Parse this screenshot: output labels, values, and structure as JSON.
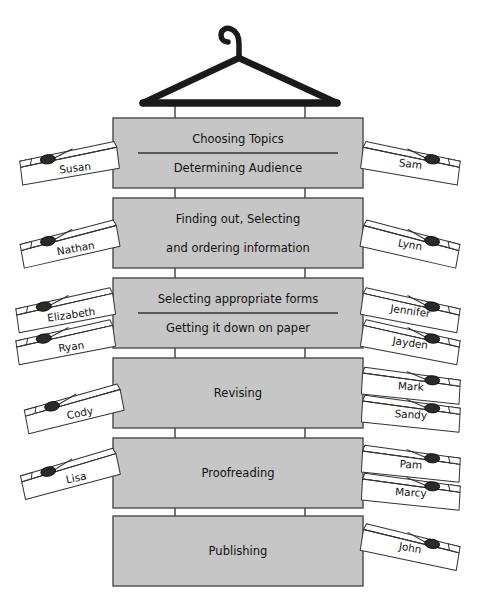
{
  "diagram": {
    "title_visible": false,
    "colors": {
      "box_fill": "#c6c6c6",
      "box_stroke": "#4a4a4a",
      "hanger": "#1a1a1a",
      "pin_fill": "#ffffff",
      "pin_stroke": "#333333",
      "spring_fill": "#2a2a2a",
      "connector": "#555555",
      "page_bg": "#ffffff"
    },
    "hanger": {
      "name": "coat-hanger",
      "hook_top_y": 18,
      "bar_y": 103,
      "bar_left_x": 165,
      "bar_right_x": 315
    },
    "stages": [
      {
        "id": "stage-1",
        "lines": [
          "Choosing Topics",
          "Determining Audience"
        ],
        "divider": true,
        "box": {
          "x": 113,
          "y": 118,
          "w": 250,
          "h": 70
        },
        "left_pins": [
          {
            "name": "Susan",
            "x": 18,
            "y": 140,
            "rot": -7
          }
        ],
        "right_pins": [
          {
            "name": "Sam",
            "x": 360,
            "y": 140,
            "rot": 7
          }
        ]
      },
      {
        "id": "stage-2",
        "lines": [
          "Finding out, Selecting",
          "and ordering information"
        ],
        "divider": false,
        "box": {
          "x": 113,
          "y": 198,
          "w": 250,
          "h": 70
        },
        "left_pins": [
          {
            "name": "Nathan",
            "x": 18,
            "y": 218,
            "rot": -10
          }
        ],
        "right_pins": [
          {
            "name": "Lynn",
            "x": 360,
            "y": 218,
            "rot": 10
          }
        ]
      },
      {
        "id": "stage-3",
        "lines": [
          "Selecting appropriate forms",
          "Getting it down on paper"
        ],
        "divider": true,
        "box": {
          "x": 113,
          "y": 278,
          "w": 250,
          "h": 70
        },
        "left_pins": [
          {
            "name": "Elizabeth",
            "x": 14,
            "y": 286,
            "rot": -8
          },
          {
            "name": "Ryan",
            "x": 14,
            "y": 318,
            "rot": -8
          }
        ],
        "right_pins": [
          {
            "name": "Jennifer",
            "x": 360,
            "y": 286,
            "rot": 8
          },
          {
            "name": "Jayden",
            "x": 360,
            "y": 318,
            "rot": 8
          }
        ]
      },
      {
        "id": "stage-4",
        "lines": [
          "Revising"
        ],
        "divider": false,
        "box": {
          "x": 113,
          "y": 358,
          "w": 250,
          "h": 70
        },
        "left_pins": [
          {
            "name": "Cody",
            "x": 22,
            "y": 382,
            "rot": -11
          }
        ],
        "right_pins": [
          {
            "name": "Mark",
            "x": 360,
            "y": 366,
            "rot": 3
          },
          {
            "name": "Sandy",
            "x": 360,
            "y": 394,
            "rot": 3
          }
        ]
      },
      {
        "id": "stage-5",
        "lines": [
          "Proofreading"
        ],
        "divider": false,
        "box": {
          "x": 113,
          "y": 438,
          "w": 250,
          "h": 70
        },
        "left_pins": [
          {
            "name": "Lisa",
            "x": 18,
            "y": 446,
            "rot": -12
          }
        ],
        "right_pins": [
          {
            "name": "Pam",
            "x": 360,
            "y": 444,
            "rot": 3
          },
          {
            "name": "Marcy",
            "x": 360,
            "y": 472,
            "rot": 3
          }
        ]
      },
      {
        "id": "stage-6",
        "lines": [
          "Publishing"
        ],
        "divider": false,
        "box": {
          "x": 113,
          "y": 516,
          "w": 250,
          "h": 70
        },
        "left_pins": [],
        "right_pins": [
          {
            "name": "John",
            "x": 360,
            "y": 522,
            "rot": 9
          }
        ]
      }
    ],
    "connectors": {
      "left_x": 175,
      "right_x": 305
    },
    "all_names": [
      "Susan",
      "Sam",
      "Nathan",
      "Lynn",
      "Elizabeth",
      "Ryan",
      "Jennifer",
      "Jayden",
      "Cody",
      "Mark",
      "Sandy",
      "Lisa",
      "Pam",
      "Marcy",
      "John"
    ],
    "all_stage_labels": [
      "Choosing Topics",
      "Determining Audience",
      "Finding out, Selecting",
      "and ordering information",
      "Selecting appropriate forms",
      "Getting it down on paper",
      "Revising",
      "Proofreading",
      "Publishing"
    ]
  }
}
